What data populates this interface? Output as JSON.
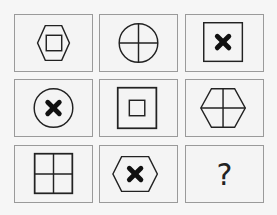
{
  "puzzle": {
    "type": "3x3 figure reasoning matrix",
    "colors": {
      "stroke": "#222222",
      "cell_border": "#9a9a9a",
      "background": "#f6f6f6"
    },
    "cells": [
      {
        "row": 1,
        "col": 1,
        "outer": "hexagon",
        "inner": "small-square"
      },
      {
        "row": 1,
        "col": 2,
        "outer": "circle",
        "inner": "cross-lines"
      },
      {
        "row": 1,
        "col": 3,
        "outer": "square",
        "inner": "bold-x"
      },
      {
        "row": 2,
        "col": 1,
        "outer": "circle",
        "inner": "bold-x"
      },
      {
        "row": 2,
        "col": 2,
        "outer": "square",
        "inner": "small-square"
      },
      {
        "row": 2,
        "col": 3,
        "outer": "hexagon",
        "inner": "cross-lines"
      },
      {
        "row": 3,
        "col": 1,
        "outer": "square",
        "inner": "cross-lines"
      },
      {
        "row": 3,
        "col": 2,
        "outer": "hexagon",
        "inner": "bold-x"
      },
      {
        "row": 3,
        "col": 3,
        "outer": "",
        "inner": "",
        "label": "?"
      }
    ]
  }
}
